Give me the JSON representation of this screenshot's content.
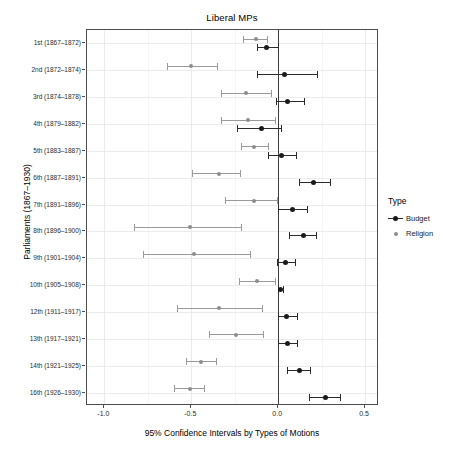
{
  "chart_data": {
    "type": "scatter",
    "title": "Liberal MPs",
    "xlabel": "95% Confidence Intervals by Types of Motions",
    "ylabel": "Parliaments (1867–1930)",
    "xlim": [
      -1.1,
      0.58
    ],
    "xticks": [
      -1.0,
      -0.5,
      0.0,
      0.5
    ],
    "xticklabels": [
      "-1.0",
      "-0.5",
      "0.0",
      "0.5"
    ],
    "grid": true,
    "legend_position": "right",
    "reference_line_x": 0.0,
    "categories": [
      "1st (1867–1872)",
      "2nd (1872–1874)",
      "3rd (1874–1878)",
      "4th (1879–1882)",
      "5th (1883–1887)",
      "6th (1887–1891)",
      "7th (1891–1896)",
      "8th (1896–1900)",
      "9th (1901–1904)",
      "10th (1905–1908)",
      "12th (1911–1917)",
      "13th (1917–1921)",
      "14th (1921–1925)",
      "16th (1926–1930)"
    ],
    "series": [
      {
        "name": "Budget",
        "color": "#1a1a1a",
        "estimates": [
          -0.065,
          0.035,
          0.055,
          -0.095,
          0.02,
          0.205,
          0.085,
          0.145,
          0.04,
          0.015,
          0.05,
          0.055,
          0.12,
          0.27
        ],
        "ci_low": [
          -0.12,
          -0.12,
          -0.015,
          -0.235,
          -0.06,
          0.12,
          0.0,
          0.06,
          -0.005,
          0.0,
          0.0,
          0.0,
          0.05,
          0.18
        ],
        "ci_high": [
          0.0,
          0.225,
          0.15,
          0.015,
          0.105,
          0.3,
          0.165,
          0.22,
          0.095,
          0.03,
          0.11,
          0.11,
          0.185,
          0.355
        ]
      },
      {
        "name": "Religion",
        "color": "#8d8d8d",
        "estimates": [
          -0.13,
          -0.5,
          -0.185,
          -0.175,
          -0.14,
          -0.34,
          -0.14,
          -0.51,
          -0.485,
          -0.12,
          -0.34,
          -0.24,
          -0.445,
          -0.51
        ],
        "ci_low": [
          -0.205,
          -0.64,
          -0.33,
          -0.33,
          -0.215,
          -0.495,
          -0.305,
          -0.83,
          -0.78,
          -0.225,
          -0.585,
          -0.4,
          -0.53,
          -0.6
        ],
        "ci_high": [
          -0.065,
          -0.35,
          -0.04,
          -0.02,
          -0.06,
          -0.22,
          -0.005,
          -0.215,
          -0.165,
          -0.02,
          -0.095,
          -0.085,
          -0.355,
          -0.425
        ]
      }
    ]
  },
  "legend": {
    "title": "Type",
    "entries": [
      {
        "label": "Budget"
      },
      {
        "label": "Religion"
      }
    ]
  }
}
